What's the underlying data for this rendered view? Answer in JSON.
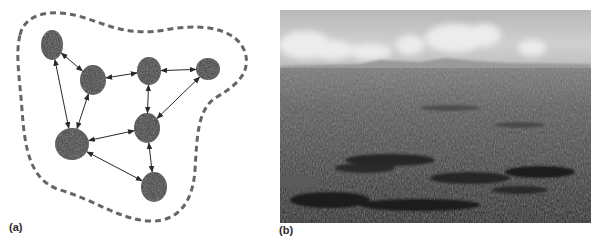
{
  "panels": {
    "a": {
      "label": "(a)",
      "description": "Network of nodes connected by bidirectional arrows, enclosed by a dashed boundary",
      "nodes": [
        {
          "id": "n1",
          "cx": 52,
          "cy": 45,
          "rx": 11,
          "ry": 15
        },
        {
          "id": "n2",
          "cx": 93,
          "cy": 80,
          "rx": 13,
          "ry": 15
        },
        {
          "id": "n3",
          "cx": 149,
          "cy": 71,
          "rx": 12,
          "ry": 14
        },
        {
          "id": "n4",
          "cx": 208,
          "cy": 69,
          "rx": 12,
          "ry": 11
        },
        {
          "id": "n5",
          "cx": 147,
          "cy": 128,
          "rx": 13,
          "ry": 15
        },
        {
          "id": "n6",
          "cx": 72,
          "cy": 144,
          "rx": 17,
          "ry": 16
        },
        {
          "id": "n7",
          "cx": 154,
          "cy": 187,
          "rx": 13,
          "ry": 15
        }
      ],
      "edges": [
        [
          "n1",
          "n2"
        ],
        [
          "n1",
          "n6"
        ],
        [
          "n2",
          "n3"
        ],
        [
          "n2",
          "n6"
        ],
        [
          "n3",
          "n4"
        ],
        [
          "n3",
          "n5"
        ],
        [
          "n4",
          "n5"
        ],
        [
          "n5",
          "n6"
        ],
        [
          "n5",
          "n7"
        ],
        [
          "n6",
          "n7"
        ]
      ],
      "colors": {
        "node_fill": "#3a3a3a",
        "edge": "#2a2a2a",
        "boundary": "#666666"
      }
    },
    "b": {
      "label": "(b)",
      "description": "Grayscale aerial landscape photograph: cloudy sky over a flat horizon, dark patterned terrain in the foreground"
    }
  }
}
